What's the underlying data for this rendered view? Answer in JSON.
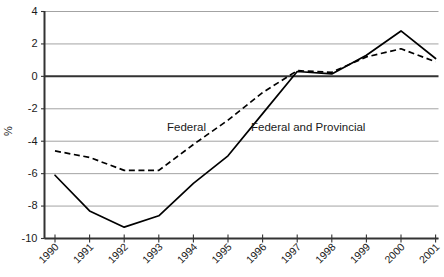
{
  "chart_data": {
    "type": "line",
    "title": "",
    "xlabel": "",
    "ylabel": "%",
    "categories": [
      "1990",
      "1991",
      "1992",
      "1993",
      "1994",
      "1995",
      "1996",
      "1997",
      "1998",
      "1999",
      "2000",
      "2001"
    ],
    "x": [
      1990,
      1991,
      1992,
      1993,
      1994,
      1995,
      1996,
      1997,
      1998,
      1999,
      2000,
      2001
    ],
    "series": [
      {
        "name": "Federal",
        "style": "dashed",
        "values": [
          -4.6,
          -5.0,
          -5.8,
          -5.8,
          -4.2,
          -2.7,
          -1.0,
          0.35,
          0.25,
          1.2,
          1.7,
          0.9
        ]
      },
      {
        "name": "Federal and Provincial",
        "style": "solid",
        "values": [
          -6.1,
          -8.3,
          -9.3,
          -8.6,
          -6.6,
          -4.9,
          -2.3,
          0.3,
          0.15,
          1.3,
          2.8,
          1.1
        ]
      }
    ],
    "ylim": [
      -10,
      4
    ],
    "yticks": [
      4,
      2,
      0,
      -2,
      -4,
      -6,
      -8,
      -10
    ],
    "ytick_labels": [
      "4",
      "2",
      "0",
      "-2",
      "-4",
      "-6",
      "-8",
      "-10"
    ],
    "grid": true,
    "legend_position": "inline-annotations",
    "annotations": [
      {
        "text": "Federal",
        "series": "Federal"
      },
      {
        "text": "Federal and Provincial",
        "series": "Federal and Provincial"
      }
    ],
    "colors": {
      "series_line": "#000000",
      "gridline": "#8c8c8c",
      "axis": "#333333",
      "text": "#1a1a1a",
      "background": "#ffffff"
    }
  }
}
